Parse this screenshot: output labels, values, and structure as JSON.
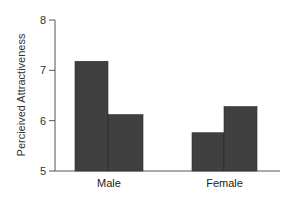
{
  "chart_data": {
    "type": "bar",
    "title": "",
    "xlabel": "",
    "ylabel": "Percieived Attractiveness",
    "ylim": [
      5,
      8
    ],
    "yticks": [
      5,
      6,
      7,
      8
    ],
    "categories": [
      "Male",
      "Female"
    ],
    "series": [
      {
        "name": "Series 1",
        "values": [
          7.18,
          5.76
        ]
      },
      {
        "name": "Series 2",
        "values": [
          6.12,
          6.28
        ]
      }
    ],
    "legend": null,
    "grid": false
  },
  "colors": {
    "bar": "#404040",
    "bar_edge": "#2a2a2a",
    "axis": "#555555"
  }
}
